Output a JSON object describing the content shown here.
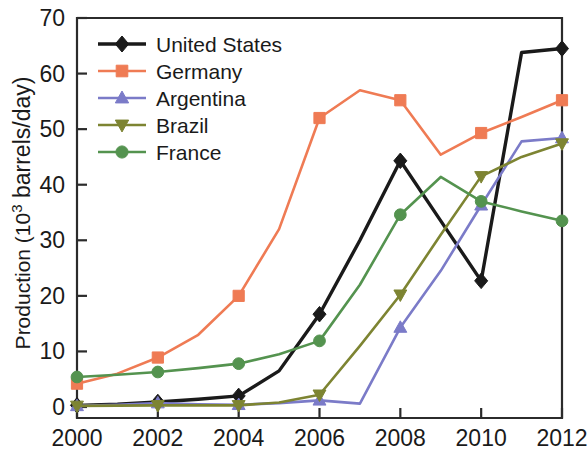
{
  "chart_data": {
    "type": "line",
    "title": "",
    "xlabel": "",
    "ylabel": "Production (10³ barrels/day)",
    "ylabel_main": "Production (10",
    "ylabel_sup": "3",
    "ylabel_tail": " barrels/day)",
    "xlim": [
      2000,
      2012
    ],
    "ylim": [
      0,
      70
    ],
    "grid": false,
    "legend_position": "top-left-inside",
    "x_tick_labels": [
      "2000",
      "2002",
      "2004",
      "2006",
      "2008",
      "2010",
      "2012"
    ],
    "x_tick_values": [
      2000,
      2002,
      2004,
      2006,
      2008,
      2010,
      2012
    ],
    "y_tick_labels": [
      "0",
      "10",
      "20",
      "30",
      "40",
      "50",
      "60",
      "70"
    ],
    "y_tick_values": [
      0,
      10,
      20,
      30,
      40,
      50,
      60,
      70
    ],
    "x": [
      2000,
      2001,
      2002,
      2003,
      2004,
      2005,
      2006,
      2007,
      2008,
      2009,
      2010,
      2011,
      2012
    ],
    "series": [
      {
        "name": "United States",
        "color": "#1a1a1a",
        "marker": "diamond",
        "marker_x": [
          2000,
          2002,
          2004,
          2006,
          2008,
          2010,
          2012
        ],
        "marker_values": [
          0.3,
          0.9,
          2.0,
          16.7,
          44.3,
          22.7,
          64.5
        ],
        "values": [
          0.3,
          0.5,
          0.9,
          1.4,
          2.0,
          6.5,
          16.7,
          30.0,
          44.3,
          33.5,
          22.7,
          63.8,
          64.5
        ]
      },
      {
        "name": "Germany",
        "color": "#ef7b54",
        "marker": "square",
        "marker_x": [
          2000,
          2002,
          2004,
          2006,
          2008,
          2010,
          2012
        ],
        "marker_values": [
          4.2,
          8.9,
          20.0,
          52.0,
          55.2,
          49.3,
          55.2
        ],
        "values": [
          4.2,
          6.0,
          8.9,
          13.0,
          20.0,
          32.0,
          52.0,
          57.0,
          55.2,
          45.4,
          49.3,
          52.2,
          55.2
        ]
      },
      {
        "name": "Argentina",
        "color": "#7b7bc8",
        "marker": "triangle-up",
        "marker_x": [
          2000,
          2002,
          2004,
          2006,
          2008,
          2010,
          2012
        ],
        "marker_values": [
          0.2,
          0.7,
          0.4,
          1.2,
          14.3,
          36.3,
          48.4
        ],
        "values": [
          0.2,
          0.4,
          0.7,
          0.5,
          0.4,
          0.7,
          1.2,
          0.6,
          14.3,
          24.5,
          36.3,
          47.8,
          48.4
        ]
      },
      {
        "name": "Brazil",
        "color": "#7d8432",
        "marker": "triangle-down",
        "marker_x": [
          2000,
          2002,
          2004,
          2006,
          2008,
          2010,
          2012
        ],
        "marker_values": [
          0.2,
          0.3,
          0.3,
          2.2,
          20.2,
          41.5,
          47.4
        ],
        "values": [
          0.2,
          0.25,
          0.3,
          0.3,
          0.3,
          0.8,
          2.2,
          11.0,
          20.2,
          31.0,
          41.5,
          45.0,
          47.4
        ]
      },
      {
        "name": "France",
        "color": "#54934f",
        "marker": "circle",
        "marker_x": [
          2000,
          2002,
          2004,
          2006,
          2008,
          2010,
          2012
        ],
        "marker_values": [
          5.4,
          6.3,
          7.8,
          11.9,
          34.6,
          37.0,
          33.5
        ],
        "values": [
          5.4,
          5.8,
          6.3,
          7.0,
          7.8,
          9.5,
          11.9,
          22.0,
          34.6,
          41.4,
          37.0,
          35.2,
          33.5
        ]
      }
    ]
  },
  "legend": {
    "entries": [
      {
        "label": "United States"
      },
      {
        "label": "Germany"
      },
      {
        "label": "Argentina"
      },
      {
        "label": "Brazil"
      },
      {
        "label": "France"
      }
    ]
  }
}
